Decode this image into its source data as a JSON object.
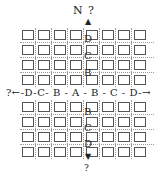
{
  "north_label": "N ?",
  "south_label": "?",
  "horizontal_axis": "?←-D-C- B - A - B - C - D-→",
  "vertical_top": [
    "D",
    "C",
    "B"
  ],
  "vertical_bottom": [
    "B",
    "C",
    "D"
  ],
  "grid": {
    "columns": 8,
    "rows_above": 4,
    "rows_below": 4
  }
}
